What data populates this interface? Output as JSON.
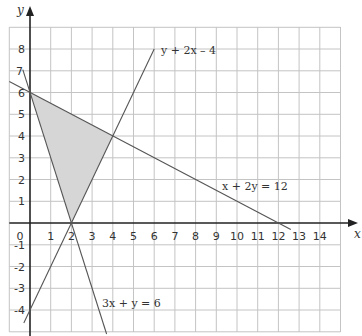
{
  "diagram": {
    "title": "",
    "axes": {
      "x_label": "x",
      "y_label": "y",
      "x_range": [
        -1,
        15
      ],
      "y_range": [
        -5,
        9
      ]
    },
    "x_ticks": [
      "0",
      "1",
      "2",
      "3",
      "4",
      "5",
      "6",
      "7",
      "8",
      "9",
      "10",
      "11",
      "12",
      "13",
      "14"
    ],
    "y_ticks": [
      "8",
      "7",
      "6",
      "5",
      "4",
      "3",
      "2",
      "1",
      "-1",
      "-2",
      "-3",
      "-4"
    ],
    "lines": [
      {
        "label": "y + 2x – 4",
        "equation": "y = 2x - 4"
      },
      {
        "label": "x + 2y = 12",
        "equation": "x + 2y = 12"
      },
      {
        "label": "3x + y = 6",
        "equation": "3x + y = 6"
      }
    ],
    "shaded_region": {
      "vertices": [
        [
          0,
          6
        ],
        [
          2,
          0
        ],
        [
          4,
          4
        ]
      ],
      "color": "#d3d3d3"
    },
    "colors": {
      "grid": "#bdbdbd",
      "axis": "#222222",
      "line": "#555555"
    }
  }
}
